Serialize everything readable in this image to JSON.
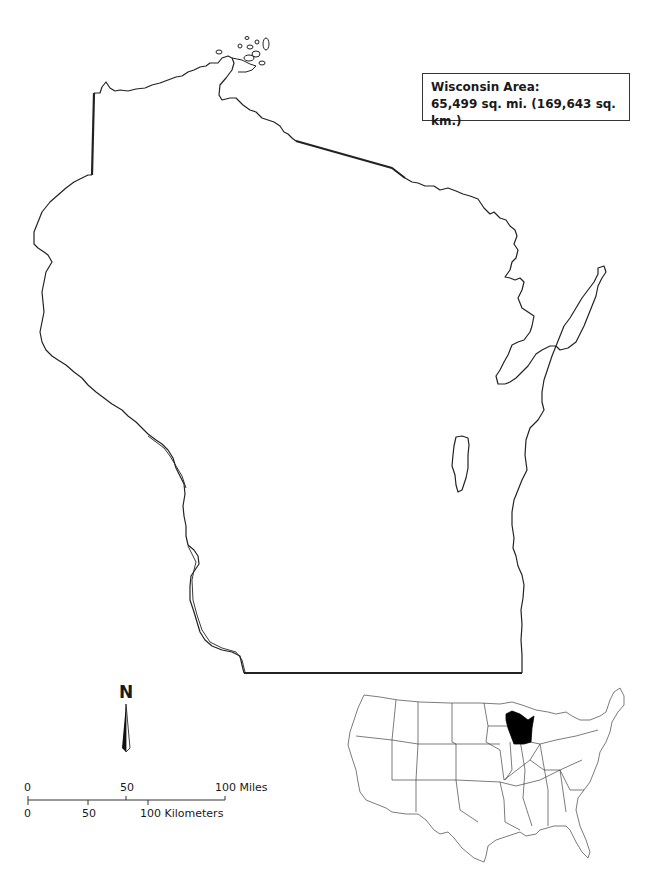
{
  "map": {
    "title": "Wisconsin",
    "area_box": {
      "line1": "Wisconsin Area:",
      "line2": "65,499 sq. mi. (169,643 sq. km.)"
    },
    "north_arrow": {
      "label": "N",
      "icon": "north-arrow-icon"
    },
    "scale_bar": {
      "miles": {
        "ticks": [
          "0",
          "50",
          "100 Miles"
        ]
      },
      "kilometers": {
        "ticks": [
          "0",
          "50",
          "100 Kilometers"
        ]
      }
    },
    "locator_map": {
      "region": "Contiguous United States",
      "highlighted_state": "Wisconsin",
      "highlight_color": "#000000"
    },
    "colors": {
      "outline": "#222222",
      "background": "#ffffff"
    }
  }
}
